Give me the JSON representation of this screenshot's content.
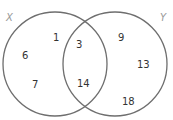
{
  "diagram": {
    "type": "venn",
    "sets": [
      {
        "name": "X",
        "label": "X"
      },
      {
        "name": "Y",
        "label": "Y"
      }
    ],
    "regions": {
      "x_only": [
        "1",
        "6",
        "7"
      ],
      "intersection": [
        "3",
        "14"
      ],
      "y_only": [
        "9",
        "13",
        "18"
      ]
    },
    "elements": [
      {
        "value": "1",
        "region": "X only"
      },
      {
        "value": "6",
        "region": "X only"
      },
      {
        "value": "7",
        "region": "X only"
      },
      {
        "value": "3",
        "region": "X and Y"
      },
      {
        "value": "14",
        "region": "X and Y"
      },
      {
        "value": "9",
        "region": "Y only"
      },
      {
        "value": "13",
        "region": "Y only"
      },
      {
        "value": "18",
        "region": "Y only"
      }
    ],
    "colors": {
      "circle_stroke": "#6e6e6e",
      "set_label": "#9a9a9a",
      "number_text": "#333333"
    }
  }
}
